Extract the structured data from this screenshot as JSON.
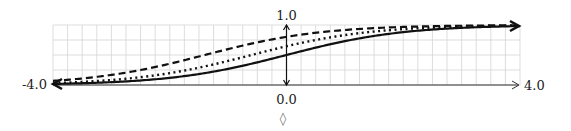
{
  "chart_data": {
    "type": "line",
    "title": "",
    "xlabel": "",
    "ylabel": "",
    "xlim": [
      -4.0,
      4.0
    ],
    "ylim": [
      0.0,
      1.0
    ],
    "grid": true,
    "x_tick_labels": {
      "min": "-4.0",
      "zero": "0.0",
      "max": "4.0"
    },
    "y_tick_labels": {
      "max": "1.0"
    },
    "series": [
      {
        "name": "solid",
        "style": "solid",
        "shift": 0.0,
        "x": [
          -4,
          -3,
          -2,
          -1,
          0,
          1,
          2,
          3,
          4
        ],
        "values": [
          0.02,
          0.05,
          0.12,
          0.27,
          0.5,
          0.73,
          0.88,
          0.95,
          0.98
        ]
      },
      {
        "name": "dotted",
        "style": "dotted",
        "shift": 0.6,
        "x": [
          -4,
          -3,
          -2,
          -1,
          0,
          1,
          2,
          3,
          4
        ],
        "values": [
          0.03,
          0.08,
          0.2,
          0.4,
          0.65,
          0.83,
          0.93,
          0.97,
          0.99
        ]
      },
      {
        "name": "dashed",
        "style": "dashed",
        "shift": 1.4,
        "x": [
          -4,
          -3,
          -2,
          -1,
          0,
          1,
          2,
          3,
          4
        ],
        "values": [
          0.07,
          0.17,
          0.35,
          0.6,
          0.8,
          0.92,
          0.97,
          0.99,
          0.99
        ]
      }
    ],
    "legend": null,
    "annotation": "◊"
  }
}
